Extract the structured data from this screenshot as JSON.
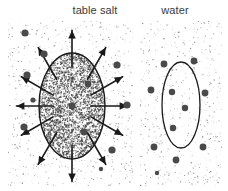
{
  "figure": {
    "width": 228,
    "height": 191,
    "background_color": "#ffffff",
    "type": "scientific-illustration",
    "ink_color": "#1a1a1a",
    "particle_color": "#4a4a4a",
    "stipple_color": "#6b6b6b",
    "label_color": "#3a3a3a"
  },
  "panels": [
    {
      "id": "table-salt",
      "label": "table salt",
      "label_x": 95,
      "label_y": 14,
      "rect": {
        "x": 8,
        "y": 21,
        "width": 125,
        "height": 165
      },
      "stipple_density": 0.16,
      "ellipse": {
        "cx": 72,
        "cy": 106,
        "rx": 33,
        "ry": 53,
        "filled": true,
        "fill_stipple_density": 0.62,
        "stroke": "#1a1a1a",
        "stroke_width": 1.4
      },
      "arrows": {
        "count": 12,
        "angles_deg": [
          270,
          300,
          330,
          0,
          30,
          60,
          90,
          120,
          150,
          180,
          210,
          240
        ],
        "inner_offset": -14,
        "length": 24,
        "head_size": 5,
        "stroke_width": 1.6,
        "color": "#1a1a1a"
      },
      "particles_inside": [
        {
          "x": 72,
          "y": 106,
          "r": 3.4
        },
        {
          "x": 88,
          "y": 84,
          "r": 3.4
        },
        {
          "x": 84,
          "y": 132,
          "r": 3.4
        }
      ],
      "particles_outside": [
        {
          "x": 25,
          "y": 33,
          "r": 3.6
        },
        {
          "x": 44,
          "y": 54,
          "r": 3.6
        },
        {
          "x": 27,
          "y": 75,
          "r": 3.6
        },
        {
          "x": 24,
          "y": 127,
          "r": 3.6
        },
        {
          "x": 117,
          "y": 65,
          "r": 3.6
        },
        {
          "x": 127,
          "y": 105,
          "r": 3.6
        },
        {
          "x": 112,
          "y": 150,
          "r": 3.6
        },
        {
          "x": 33,
          "y": 100,
          "r": 2.6
        },
        {
          "x": 101,
          "y": 169,
          "r": 2.2
        }
      ]
    },
    {
      "id": "water",
      "label": "water",
      "label_x": 175,
      "label_y": 14,
      "rect": {
        "x": 140,
        "y": 21,
        "width": 82,
        "height": 165
      },
      "stipple_density": 0.16,
      "ellipse": {
        "cx": 181,
        "cy": 105,
        "rx": 19,
        "ry": 43,
        "filled": false,
        "fill_stipple_density": 0,
        "stroke": "#1a1a1a",
        "stroke_width": 1.3
      },
      "arrows": {
        "count": 0,
        "angles_deg": [],
        "inner_offset": 0,
        "length": 0,
        "head_size": 0,
        "stroke_width": 0,
        "color": "#1a1a1a"
      },
      "particles_inside": [
        {
          "x": 172,
          "y": 92,
          "r": 3.2
        },
        {
          "x": 185,
          "y": 108,
          "r": 3.2
        },
        {
          "x": 173,
          "y": 128,
          "r": 3.2
        }
      ],
      "particles_outside": [
        {
          "x": 164,
          "y": 64,
          "r": 3.4
        },
        {
          "x": 194,
          "y": 61,
          "r": 3.4
        },
        {
          "x": 151,
          "y": 90,
          "r": 3.4
        },
        {
          "x": 205,
          "y": 93,
          "r": 3.4
        },
        {
          "x": 154,
          "y": 147,
          "r": 3.4
        },
        {
          "x": 203,
          "y": 147,
          "r": 3.4
        },
        {
          "x": 176,
          "y": 160,
          "r": 3.4
        },
        {
          "x": 157,
          "y": 173,
          "r": 2.2
        }
      ]
    }
  ]
}
